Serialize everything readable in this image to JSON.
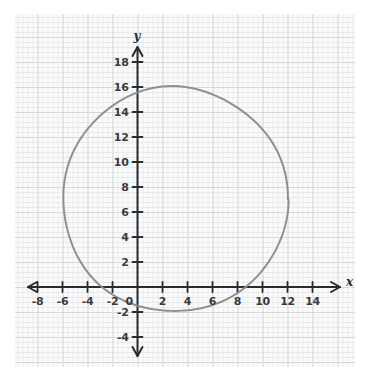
{
  "figure": {
    "background_color": "#ffffff",
    "paper_color": "#fbfbfc",
    "grid_minor_color": "#e9eaee",
    "grid_major_color": "#d6d8de",
    "axis_color": "#2b2b2b",
    "curve_color": "#8a8a8a",
    "label_color": "#3a3a3a"
  },
  "axis_names": {
    "x": "x",
    "y": "y"
  },
  "chart_data": {
    "type": "scatter",
    "title": "",
    "subtitle": "",
    "xlabel": "x",
    "ylabel": "y",
    "xlim": [
      -9,
      15
    ],
    "ylim": [
      -5,
      19
    ],
    "grid": true,
    "grid_major_step": 2,
    "grid_minor_step": 0.4,
    "legend": null,
    "x_ticks": [
      -8,
      -6,
      -4,
      -2,
      0,
      2,
      4,
      6,
      8,
      10,
      12,
      14
    ],
    "x_tick_labels": [
      "-8",
      "-6",
      "-4",
      "-2",
      "0",
      "2",
      "4",
      "6",
      "8",
      "10",
      "12",
      "14"
    ],
    "y_ticks": [
      -4,
      -2,
      2,
      4,
      6,
      8,
      10,
      12,
      14,
      16,
      18
    ],
    "y_tick_labels": [
      "-4",
      "-2",
      "2",
      "4",
      "6",
      "8",
      "10",
      "12",
      "14",
      "16",
      "18"
    ],
    "origin_label": "0",
    "series": [
      {
        "name": "circle",
        "type": "circle",
        "center_x": 3,
        "center_y": 7,
        "radius": 9,
        "equation": "(x - 3)^2 + (y - 7)^2 = 81",
        "stroke": "#8a8a8a",
        "stroke_width": 2,
        "fill": "none",
        "extrema": {
          "leftmost": [
            -6,
            7
          ],
          "rightmost": [
            12,
            7
          ],
          "topmost": [
            3,
            16
          ],
          "bottommost": [
            3,
            -2
          ]
        }
      }
    ],
    "annotations": []
  }
}
